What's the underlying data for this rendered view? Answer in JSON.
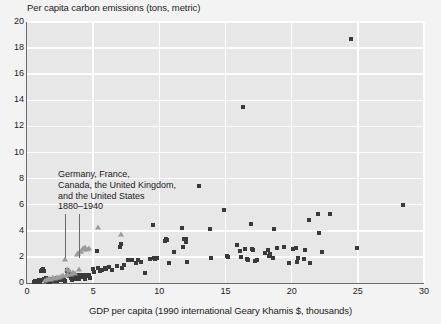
{
  "chart_data": {
    "type": "scatter",
    "title": "",
    "ylabel": "Per capita carbon emissions (tons, metric)",
    "xlabel": "GDP per capita (1990 international Geary Khamis $, thousands)",
    "xlim": [
      0,
      30
    ],
    "ylim": [
      0,
      20
    ],
    "xticks": [
      0,
      5,
      10,
      15,
      20,
      25,
      30
    ],
    "yticks": [
      0,
      2,
      4,
      6,
      8,
      10,
      12,
      14,
      16,
      18,
      20
    ],
    "grid": true,
    "legend": "none",
    "annotations": [
      {
        "text_lines": [
          "Germany, France,",
          "Canada, the United Kingdom,",
          "and the United States",
          "1880–1940"
        ],
        "points_to": [
          2.9,
          3.9
        ]
      }
    ],
    "series": [
      {
        "name": "other-countries",
        "marker": "square",
        "color": "#3a3a3a",
        "points": [
          [
            0.55,
            0.08
          ],
          [
            0.62,
            0.12
          ],
          [
            0.7,
            0.06
          ],
          [
            0.78,
            0.15
          ],
          [
            0.85,
            0.1
          ],
          [
            0.9,
            0.2
          ],
          [
            0.95,
            0.05
          ],
          [
            1.0,
            0.18
          ],
          [
            1.05,
            0.9
          ],
          [
            1.1,
            1.0
          ],
          [
            1.12,
            0.25
          ],
          [
            1.2,
            1.1
          ],
          [
            1.25,
            0.3
          ],
          [
            1.3,
            0.95
          ],
          [
            1.35,
            0.2
          ],
          [
            1.4,
            0.12
          ],
          [
            1.45,
            0.35
          ],
          [
            1.5,
            0.22
          ],
          [
            1.55,
            0.08
          ],
          [
            1.6,
            0.3
          ],
          [
            1.65,
            0.15
          ],
          [
            1.7,
            0.25
          ],
          [
            1.75,
            0.1
          ],
          [
            1.8,
            0.2
          ],
          [
            1.85,
            0.33
          ],
          [
            1.9,
            0.18
          ],
          [
            1.95,
            0.28
          ],
          [
            2.0,
            0.12
          ],
          [
            2.05,
            0.22
          ],
          [
            2.1,
            0.3
          ],
          [
            2.15,
            0.15
          ],
          [
            2.2,
            0.2
          ],
          [
            2.25,
            0.35
          ],
          [
            2.3,
            0.18
          ],
          [
            2.4,
            0.25
          ],
          [
            2.5,
            0.3
          ],
          [
            2.6,
            0.2
          ],
          [
            2.7,
            0.28
          ],
          [
            2.8,
            0.22
          ],
          [
            2.9,
            0.18
          ],
          [
            3.0,
            0.9
          ],
          [
            3.05,
            1.0
          ],
          [
            3.1,
            0.7
          ],
          [
            3.15,
            0.55
          ],
          [
            3.2,
            0.85
          ],
          [
            3.3,
            0.6
          ],
          [
            3.35,
            0.35
          ],
          [
            3.4,
            0.25
          ],
          [
            3.5,
            0.7
          ],
          [
            3.55,
            0.4
          ],
          [
            3.6,
            0.3
          ],
          [
            3.7,
            0.55
          ],
          [
            3.8,
            0.6
          ],
          [
            3.9,
            0.45
          ],
          [
            3.95,
            0.3
          ],
          [
            4.0,
            0.55
          ],
          [
            4.1,
            0.65
          ],
          [
            4.2,
            0.45
          ],
          [
            4.3,
            0.6
          ],
          [
            4.35,
            0.3
          ],
          [
            4.4,
            0.5
          ],
          [
            4.5,
            0.65
          ],
          [
            4.6,
            0.55
          ],
          [
            4.7,
            0.6
          ],
          [
            4.75,
            0.35
          ],
          [
            5.0,
            1.1
          ],
          [
            5.1,
            0.85
          ],
          [
            5.3,
            2.45
          ],
          [
            5.4,
            1.15
          ],
          [
            5.5,
            0.95
          ],
          [
            5.7,
            1.0
          ],
          [
            5.9,
            1.15
          ],
          [
            6.0,
            1.05
          ],
          [
            6.2,
            1.2
          ],
          [
            6.4,
            1.0
          ],
          [
            6.8,
            1.3
          ],
          [
            7.0,
            2.75
          ],
          [
            7.1,
            3.0
          ],
          [
            7.2,
            1.15
          ],
          [
            7.3,
            1.35
          ],
          [
            7.6,
            1.8
          ],
          [
            7.9,
            1.75
          ],
          [
            8.2,
            1.55
          ],
          [
            8.4,
            1.8
          ],
          [
            8.6,
            1.6
          ],
          [
            8.9,
            0.75
          ],
          [
            9.3,
            1.85
          ],
          [
            9.5,
            4.45
          ],
          [
            9.6,
            1.95
          ],
          [
            9.7,
            1.85
          ],
          [
            9.8,
            1.95
          ],
          [
            10.4,
            3.2
          ],
          [
            10.5,
            3.35
          ],
          [
            10.6,
            3.3
          ],
          [
            10.7,
            1.5
          ],
          [
            11.1,
            2.35
          ],
          [
            11.7,
            4.25
          ],
          [
            11.8,
            2.75
          ],
          [
            11.9,
            3.35
          ],
          [
            12.0,
            3.4
          ],
          [
            12.05,
            3.15
          ],
          [
            12.1,
            1.6
          ],
          [
            13.0,
            7.45
          ],
          [
            13.8,
            4.15
          ],
          [
            13.9,
            1.9
          ],
          [
            14.9,
            5.6
          ],
          [
            15.1,
            2.05
          ],
          [
            15.2,
            2.0
          ],
          [
            15.9,
            2.95
          ],
          [
            16.1,
            2.45
          ],
          [
            16.2,
            2.0
          ],
          [
            16.35,
            13.5
          ],
          [
            16.5,
            2.6
          ],
          [
            16.6,
            1.85
          ],
          [
            16.7,
            1.8
          ],
          [
            16.9,
            4.5
          ],
          [
            17.0,
            2.6
          ],
          [
            17.1,
            2.55
          ],
          [
            17.2,
            1.7
          ],
          [
            17.4,
            1.75
          ],
          [
            18.0,
            2.3
          ],
          [
            18.2,
            2.55
          ],
          [
            18.3,
            2.1
          ],
          [
            18.4,
            2.2
          ],
          [
            18.6,
            1.9
          ],
          [
            18.7,
            4.1
          ],
          [
            18.9,
            2.7
          ],
          [
            19.4,
            2.75
          ],
          [
            19.8,
            1.55
          ],
          [
            20.1,
            2.6
          ],
          [
            20.3,
            2.65
          ],
          [
            20.4,
            1.6
          ],
          [
            20.5,
            1.9
          ],
          [
            20.9,
            1.85
          ],
          [
            21.0,
            2.55
          ],
          [
            21.3,
            4.85
          ],
          [
            21.4,
            1.55
          ],
          [
            22.0,
            5.3
          ],
          [
            22.1,
            3.8
          ],
          [
            22.3,
            2.4
          ],
          [
            22.9,
            5.3
          ],
          [
            24.5,
            18.7
          ],
          [
            24.95,
            2.7
          ],
          [
            28.4,
            6.0
          ]
        ]
      },
      {
        "name": "germany-france-canada-uk-us-1880-1940",
        "marker": "triangle",
        "color": "#9b9b9b",
        "points": [
          [
            1.35,
            0.15
          ],
          [
            1.5,
            0.2
          ],
          [
            1.7,
            0.3
          ],
          [
            1.85,
            0.25
          ],
          [
            2.0,
            0.35
          ],
          [
            2.15,
            0.3
          ],
          [
            2.3,
            0.4
          ],
          [
            2.45,
            0.35
          ],
          [
            2.6,
            0.45
          ],
          [
            2.75,
            0.5
          ],
          [
            2.9,
            1.75
          ],
          [
            2.95,
            0.55
          ],
          [
            3.05,
            1.0
          ],
          [
            3.1,
            0.6
          ],
          [
            3.2,
            0.95
          ],
          [
            3.35,
            0.65
          ],
          [
            3.5,
            0.8
          ],
          [
            3.6,
            0.7
          ],
          [
            3.75,
            2.15
          ],
          [
            3.85,
            2.25
          ],
          [
            3.9,
            1.0
          ],
          [
            4.0,
            2.4
          ],
          [
            4.1,
            2.35
          ],
          [
            4.2,
            2.6
          ],
          [
            4.3,
            2.55
          ],
          [
            4.4,
            2.65
          ],
          [
            4.55,
            2.55
          ],
          [
            4.7,
            2.6
          ],
          [
            5.4,
            4.2
          ],
          [
            7.1,
            3.7
          ]
        ]
      }
    ]
  },
  "axis": {
    "y_title": "Per capita carbon emissions (tons, metric)",
    "x_title": "GDP per capita (1990 international Geary Khamis $, thousands)",
    "y_tick_labels": [
      "20",
      "18",
      "16",
      "14",
      "12",
      "10",
      "8",
      "6",
      "4",
      "2",
      "0"
    ],
    "x_tick_labels": [
      "0",
      "5",
      "10",
      "15",
      "20",
      "25",
      "30"
    ]
  },
  "annotation": {
    "line1": "Germany, France,",
    "line2": "Canada, the United Kingdom,",
    "line3": "and the United States",
    "line4": "1880–1940"
  },
  "colors": {
    "plot_background": "#e7e7e7",
    "page_background": "#f3f3f3",
    "gridline": "#fdfdfd",
    "square_marker": "#3a3a3a",
    "triangle_marker": "#9b9b9b",
    "axis": "#6a6a6a",
    "text": "#1c1c1c"
  }
}
